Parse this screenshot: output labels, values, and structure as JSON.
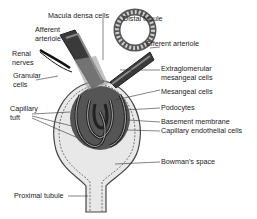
{
  "diagram": {
    "labels": {
      "macula_densa": "Macula densa cells",
      "distal_tubule": "Distal tubule",
      "afferent_1": "Afferent",
      "afferent_2": "arteriole",
      "efferent": "Efferent arteriole",
      "renal_1": "Renal",
      "renal_2": "nerves",
      "granular_1": "Granular",
      "granular_2": "cells",
      "extraglom_1": "Extraglomerular",
      "extraglom_2": "mesangeal cells",
      "mesangeal": "Mesangeal cells",
      "capillary_1": "Capillary",
      "capillary_2": "tuft",
      "podocytes": "Podocytes",
      "basement": "Basement membrane",
      "endothelial": "Capillary endothelial cells",
      "bowman": "Bowman's space",
      "proximal": "Proximal tubule"
    },
    "colors": {
      "outline": "#444444",
      "fill_light": "#e8e8e8",
      "fill_dark": "#3a3a3a",
      "fill_mid": "#8a8a8a"
    }
  }
}
